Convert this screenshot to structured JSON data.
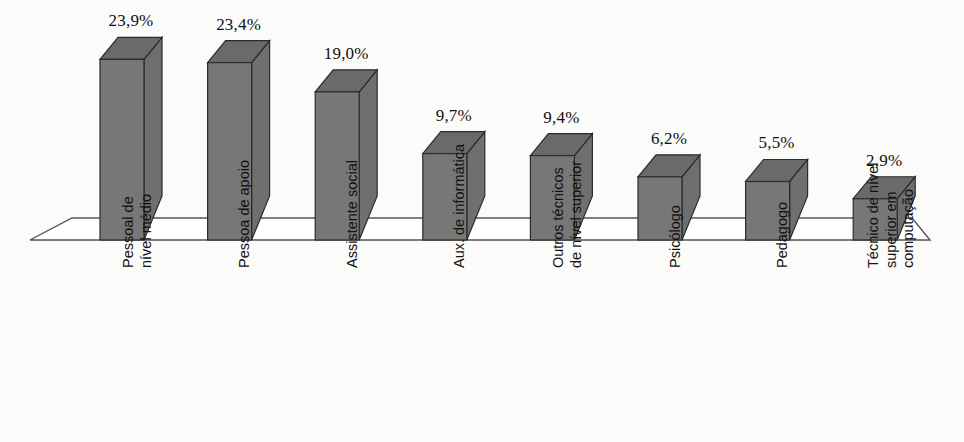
{
  "chart_data": {
    "type": "bar",
    "title": "",
    "subtitle": "",
    "xlabel": "",
    "ylabel": "",
    "grid": false,
    "legend": false,
    "style": "3d-column",
    "value_suffix": "%",
    "decimal_separator": ",",
    "ylim": [
      0,
      25
    ],
    "categories": [
      "Pessoal de nível médio",
      "Pessoa de apoio",
      "Assistente social",
      "Aux. de informática",
      "Outros técnicos de nível superior",
      "Psicólogo",
      "Pedagogo",
      "Técnico de nível superior em computação"
    ],
    "category_lines": [
      [
        "Pessoal de",
        "nível médio"
      ],
      [
        "Pessoa de apoio"
      ],
      [
        "Assistente social"
      ],
      [
        "Aux. de informática"
      ],
      [
        "Outros técnicos",
        "de nível superior"
      ],
      [
        "Psicólogo"
      ],
      [
        "Pedagogo"
      ],
      [
        "Técnico de nível",
        "superior em",
        "computação"
      ]
    ],
    "values": [
      23.9,
      23.4,
      19.0,
      9.7,
      9.4,
      6.2,
      5.5,
      2.9
    ],
    "value_labels": [
      "23,9%",
      "23,4%",
      "19,0%",
      "9,7%",
      "9,4%",
      "6,2%",
      "5,5%",
      "2,9%"
    ],
    "colors": {
      "bar_front": "#777777",
      "bar_top": "#6a6a6a",
      "bar_side": "#6f6f6f",
      "bar_outline": "#2b2b2b",
      "floor_line": "#555555",
      "background": "#fbfbfa",
      "text": "#111111"
    }
  }
}
